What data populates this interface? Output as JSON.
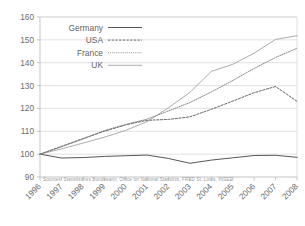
{
  "chart_data": {
    "type": "line",
    "title": "",
    "subtitle": "",
    "xlabel": "",
    "ylabel": "",
    "x": [
      1996,
      1997,
      1998,
      1999,
      2000,
      2001,
      2002,
      2003,
      2004,
      2005,
      2006,
      2007,
      2008
    ],
    "xtick_labels": [
      "1996",
      "1997",
      "1998",
      "1999",
      "2000",
      "2001",
      "2002",
      "2003",
      "2004",
      "2005",
      "2006",
      "2007",
      "2008"
    ],
    "ytick_labels": [
      "90",
      "100",
      "110",
      "120",
      "130",
      "140",
      "150",
      "160"
    ],
    "ytick_values": [
      90,
      100,
      110,
      120,
      130,
      140,
      150,
      160
    ],
    "ylim": [
      90,
      160
    ],
    "xlim": [
      1996,
      2008
    ],
    "grid": "horizontal",
    "legend_position": "top-left",
    "series": [
      {
        "name": "Germany",
        "style": "solid",
        "color": "#4d4d4d",
        "values": [
          100.0,
          98.3,
          98.5,
          99.0,
          99.3,
          99.6,
          98.1,
          96.0,
          97.4,
          98.4,
          99.4,
          99.5,
          98.6
        ]
      },
      {
        "name": "USA",
        "style": "dashed",
        "color": "#4d4d4d",
        "values": [
          100.0,
          103.4,
          106.8,
          110.0,
          112.8,
          114.8,
          115.2,
          116.3,
          119.6,
          123.2,
          126.9,
          129.6,
          123.1
        ]
      },
      {
        "name": "France",
        "style": "dotted",
        "color": "#7a7a7a",
        "values": [
          100.0,
          103.2,
          106.6,
          110.3,
          113.0,
          115.3,
          118.9,
          122.6,
          127.2,
          132.2,
          137.5,
          142.3,
          146.3
        ]
      },
      {
        "name": "UK",
        "style": "thin-solid",
        "color": "#8f8f8f",
        "values": [
          100.0,
          102.3,
          104.8,
          107.4,
          110.4,
          114.2,
          120.3,
          127.0,
          136.2,
          139.3,
          144.2,
          150.2,
          151.8
        ]
      }
    ],
    "legend": [
      "Germany",
      "USA",
      "France",
      "UK"
    ],
    "source_note": "Sources: Statistisches Bundesamt, Office for National Statistics, FRED St. Louis, INSEE",
    "colors": {
      "grid": "#d4d4d4",
      "axis": "#b6b6b6",
      "text": "#6b6b6b",
      "source": "#9a9a9a",
      "background": "#ffffff"
    }
  }
}
